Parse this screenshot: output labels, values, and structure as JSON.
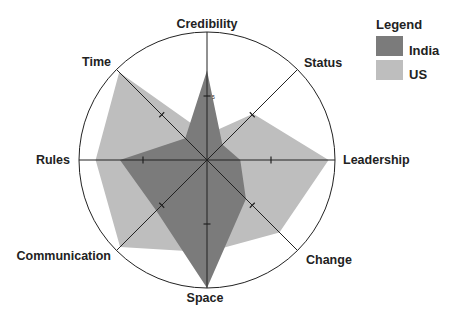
{
  "chart_data": {
    "type": "radar",
    "title": "",
    "axes": [
      "Credibility",
      "Status",
      "Leadership",
      "Change",
      "Space",
      "Communication",
      "Rules",
      "Time"
    ],
    "scale": {
      "min": 0,
      "max": 10,
      "tick": 5,
      "tick_label": "5"
    },
    "series": [
      {
        "name": "India",
        "color": "#7b7b7b",
        "values": [
          7.0,
          1.7,
          2.6,
          4.3,
          10.0,
          5.6,
          6.8,
          2.4
        ]
      },
      {
        "name": "US",
        "color": "#bebebe",
        "values": [
          2.0,
          5.1,
          9.5,
          8.0,
          7.2,
          9.6,
          8.7,
          9.7
        ]
      }
    ],
    "legend": {
      "title": "Legend",
      "position": "top-right"
    },
    "grid": {
      "outer_circle": true,
      "spokes": 8
    }
  },
  "legend": {
    "title": "Legend",
    "items": [
      {
        "label": "India",
        "color": "#7b7b7b"
      },
      {
        "label": "US",
        "color": "#bebebe"
      }
    ]
  }
}
